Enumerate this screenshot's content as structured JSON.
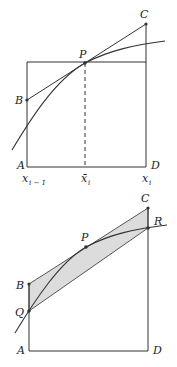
{
  "figure_top": {
    "labels": {
      "A": "A",
      "B": "B",
      "C": "C",
      "D": "D",
      "P": "P",
      "x_left": "x",
      "x_left_sub": "i − 1",
      "x_mid": "x̄",
      "x_mid_sub": "i",
      "x_right": "x",
      "x_right_sub": "i"
    }
  },
  "figure_bottom": {
    "labels": {
      "A": "A",
      "B": "B",
      "C": "C",
      "D": "D",
      "P": "P",
      "Q": "Q",
      "R": "R"
    },
    "shade_color": "#dcdcdc"
  }
}
